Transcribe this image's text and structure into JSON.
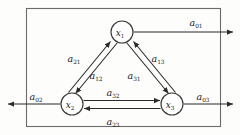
{
  "diagram": {
    "boundary": {
      "name": "system-boundary",
      "x": 26,
      "y": 8,
      "width": 194,
      "height": 118,
      "color": "#6b6b6b"
    },
    "nodes": [
      {
        "id": "x1",
        "base": "x",
        "sub": "1",
        "cx": 122,
        "cy": 32,
        "r": 11
      },
      {
        "id": "x2",
        "base": "x",
        "sub": "2",
        "cx": 72,
        "cy": 104,
        "r": 11
      },
      {
        "id": "x3",
        "base": "x",
        "sub": "3",
        "cx": 172,
        "cy": 104,
        "r": 11
      }
    ],
    "internal_edges": [
      {
        "id": "a21",
        "base": "a",
        "sub": "21",
        "from": "x2",
        "to": "x1",
        "label_x": 74,
        "label_y": 62
      },
      {
        "id": "a12",
        "base": "a",
        "sub": "12",
        "from": "x1",
        "to": "x2",
        "label_x": 96,
        "label_y": 79
      },
      {
        "id": "a13",
        "base": "a",
        "sub": "13",
        "from": "x3",
        "to": "x1",
        "label_x": 158,
        "label_y": 62
      },
      {
        "id": "a31",
        "base": "a",
        "sub": "31",
        "from": "x1",
        "to": "x3",
        "label_x": 134,
        "label_y": 79
      },
      {
        "id": "a32",
        "base": "a",
        "sub": "32",
        "from": "x2",
        "to": "x3",
        "label_x": 113,
        "label_y": 96
      },
      {
        "id": "a23",
        "base": "a",
        "sub": "23",
        "from": "x3",
        "to": "x2",
        "label_x": 113,
        "label_y": 125
      }
    ],
    "external_edges": [
      {
        "id": "a01",
        "base": "a",
        "sub": "01",
        "from": "x1",
        "direction": "right",
        "label_x": 196,
        "label_y": 26
      },
      {
        "id": "a02",
        "base": "a",
        "sub": "02",
        "from": "x2",
        "direction": "left",
        "label_x": 36,
        "label_y": 100
      },
      {
        "id": "a03",
        "base": "a",
        "sub": "03",
        "from": "x3",
        "direction": "right",
        "label_x": 203,
        "label_y": 100
      }
    ],
    "colors": {
      "edge": "#2b2b2b",
      "boundary": "#6b6b6b",
      "node_stroke": "#3a3a3a",
      "background": "#fdfdfc",
      "text": "#1a1a1a"
    }
  }
}
